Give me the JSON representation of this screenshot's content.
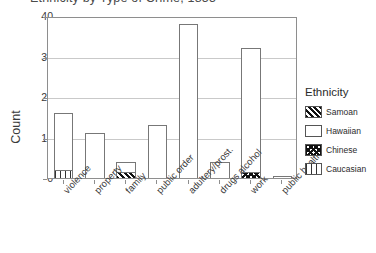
{
  "chart_data": {
    "type": "bar",
    "subtype": "stacked-bar",
    "title": "Ethnicity by Type of Crime, 1855",
    "xlabel": "",
    "ylabel": "Count",
    "ylim": [
      0,
      40
    ],
    "yticks": [
      0,
      10,
      20,
      30,
      40
    ],
    "grid": true,
    "legend_title": "Ethnicity",
    "legend_position": "right",
    "categories": [
      "violence",
      "property",
      "family",
      "public order",
      "adultery/prost.",
      "drugs alcohol",
      "work",
      "public health"
    ],
    "series": [
      {
        "name": "Samoan",
        "pattern": "diagonal-hatch",
        "values": [
          0,
          0,
          1.5,
          0,
          0,
          0,
          0,
          0
        ]
      },
      {
        "name": "Hawaiian",
        "pattern": "solid-white",
        "values": [
          14,
          11,
          2.5,
          13,
          38,
          4,
          30.5,
          0.5
        ]
      },
      {
        "name": "Chinese",
        "pattern": "cross-hatch",
        "values": [
          0,
          0,
          0,
          0,
          0,
          0,
          1.5,
          0
        ]
      },
      {
        "name": "Caucasian",
        "pattern": "vertical-lines",
        "values": [
          2,
          0,
          0,
          0,
          0,
          0,
          0,
          0
        ]
      }
    ],
    "totals": [
      16,
      11,
      4,
      13,
      38,
      4,
      32,
      0.5
    ]
  },
  "legend": {
    "title": "Ethnicity",
    "entries": [
      {
        "label": "Samoan"
      },
      {
        "label": "Hawaiian"
      },
      {
        "label": "Chinese"
      },
      {
        "label": "Caucasian"
      }
    ]
  },
  "axis": {
    "y_label": "Count",
    "y_ticks": [
      "40",
      "30",
      "20",
      "10",
      "0"
    ]
  }
}
